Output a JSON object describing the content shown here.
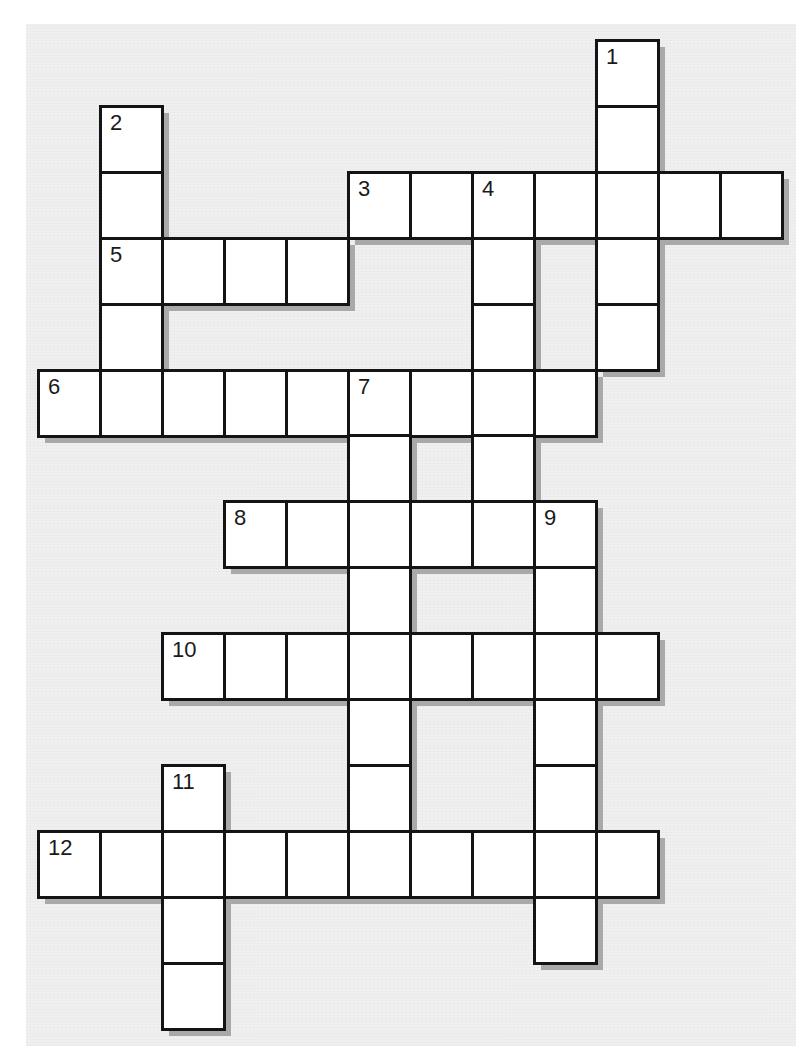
{
  "puzzle": {
    "type": "crossword",
    "grid_origin": {
      "x": 38,
      "y": 40
    },
    "cell_size": {
      "w": 62,
      "h": 65.9
    },
    "colors": {
      "background": "#f0f0f0",
      "cell": "#ffffff",
      "border": "#141414",
      "shadow": "#a9a9a9",
      "number": "#1a1a1a"
    },
    "entries": [
      {
        "number": "1",
        "direction": "down",
        "row": 0,
        "col": 9,
        "length": 5
      },
      {
        "number": "2",
        "direction": "down",
        "row": 1,
        "col": 1,
        "length": 5
      },
      {
        "number": "3",
        "direction": "across",
        "row": 2,
        "col": 5,
        "length": 7
      },
      {
        "number": "4",
        "direction": "down",
        "row": 2,
        "col": 7,
        "length": 5
      },
      {
        "number": "5",
        "direction": "across",
        "row": 3,
        "col": 1,
        "length": 4
      },
      {
        "number": "6",
        "direction": "across",
        "row": 5,
        "col": 0,
        "length": 9
      },
      {
        "number": "7",
        "direction": "down",
        "row": 5,
        "col": 5,
        "length": 7
      },
      {
        "number": "8",
        "direction": "across",
        "row": 7,
        "col": 3,
        "length": 6
      },
      {
        "number": "9",
        "direction": "down",
        "row": 7,
        "col": 8,
        "length": 7
      },
      {
        "number": "10",
        "direction": "across",
        "row": 9,
        "col": 2,
        "length": 8
      },
      {
        "number": "11",
        "direction": "down",
        "row": 11,
        "col": 2,
        "length": 4
      },
      {
        "number": "12",
        "direction": "across",
        "row": 12,
        "col": 0,
        "length": 10
      }
    ]
  }
}
